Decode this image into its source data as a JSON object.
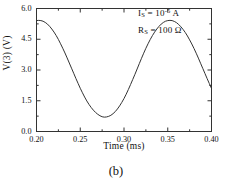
{
  "figure": {
    "caption": "(b)"
  },
  "annotations": {
    "saturation_current": {
      "symbol": "I",
      "subscript": "S",
      "equals": " = 10",
      "exponent": "-5",
      "unit": " A",
      "full_text": "I_S = 10^-5 A"
    },
    "series_resistance": {
      "symbol": "R",
      "subscript": "S",
      "equals": " = 100 ",
      "unit": "Ω",
      "full_text": "R_S = 100 Ω"
    }
  },
  "chart_data": {
    "type": "line",
    "title": "",
    "xlabel": "Time  (ms)",
    "ylabel": "V(3)  (V)",
    "xlim": [
      0.2,
      0.4
    ],
    "ylim": [
      0.0,
      6.0
    ],
    "xticks": [
      0.2,
      0.25,
      0.3,
      0.35,
      0.4
    ],
    "xtick_labels": [
      "0.20",
      "0.25",
      "0.30",
      "0.35",
      "0.40"
    ],
    "yticks": [
      0.0,
      1.5,
      3.0,
      4.5,
      6.0
    ],
    "ytick_labels": [
      "0.0",
      "1.5",
      "3.0",
      "4.5",
      "6.0"
    ],
    "x_minor_ticks_per_interval": 1,
    "y_minor_ticks_per_interval": 1,
    "grid": false,
    "legend": false,
    "line_color": "#333333",
    "line_width": 1.0,
    "waveform": {
      "shape": "sinusoidal",
      "period_ms": 0.1,
      "peak_value_v": 5.42,
      "trough_value_v": 0.7,
      "peak_times_ms": [
        0.2015,
        0.3015,
        0.4015
      ],
      "trough_times_ms": [
        0.2515,
        0.3515
      ],
      "phase_offset_ms": 0.0015
    },
    "x": [
      0.2,
      0.2025,
      0.205,
      0.2075,
      0.21,
      0.2125,
      0.215,
      0.2175,
      0.22,
      0.2225,
      0.225,
      0.2275,
      0.23,
      0.2325,
      0.235,
      0.2375,
      0.24,
      0.2425,
      0.245,
      0.2475,
      0.25,
      0.2525,
      0.255,
      0.2575,
      0.26,
      0.2625,
      0.265,
      0.2675,
      0.27,
      0.2725,
      0.275,
      0.2775,
      0.28,
      0.2825,
      0.285,
      0.2875,
      0.29,
      0.2925,
      0.295,
      0.2975,
      0.3,
      0.3025,
      0.305,
      0.3075,
      0.31,
      0.3125,
      0.315,
      0.3175,
      0.32,
      0.3225,
      0.325,
      0.3275,
      0.33,
      0.3325,
      0.335,
      0.3375,
      0.34,
      0.3425,
      0.345,
      0.3475,
      0.35,
      0.3525,
      0.355,
      0.3575,
      0.36,
      0.3625,
      0.365,
      0.3675,
      0.37,
      0.3725,
      0.375,
      0.3775,
      0.38,
      0.3825,
      0.385,
      0.3875,
      0.39,
      0.3925,
      0.395,
      0.3975,
      0.4
    ],
    "y": [
      5.41,
      5.42,
      5.41,
      5.38,
      5.32,
      5.24,
      5.13,
      5.0,
      4.85,
      4.68,
      4.49,
      4.28,
      4.06,
      3.83,
      3.59,
      3.34,
      3.09,
      2.84,
      2.59,
      2.35,
      2.11,
      1.89,
      1.68,
      1.49,
      1.32,
      1.17,
      1.04,
      0.93,
      0.84,
      0.77,
      0.72,
      0.7,
      0.71,
      0.74,
      0.79,
      0.87,
      0.97,
      1.1,
      1.25,
      1.42,
      1.61,
      1.82,
      2.05,
      2.29,
      2.54,
      2.79,
      3.05,
      3.31,
      3.57,
      3.82,
      4.06,
      4.28,
      4.49,
      4.68,
      4.85,
      5.0,
      5.13,
      5.24,
      5.32,
      5.38,
      5.41,
      5.42,
      5.41,
      5.37,
      5.31,
      5.22,
      5.11,
      4.98,
      4.83,
      4.66,
      4.47,
      4.27,
      4.05,
      3.82,
      3.58,
      3.33,
      3.08,
      2.83,
      2.58,
      2.34,
      2.1
    ]
  }
}
